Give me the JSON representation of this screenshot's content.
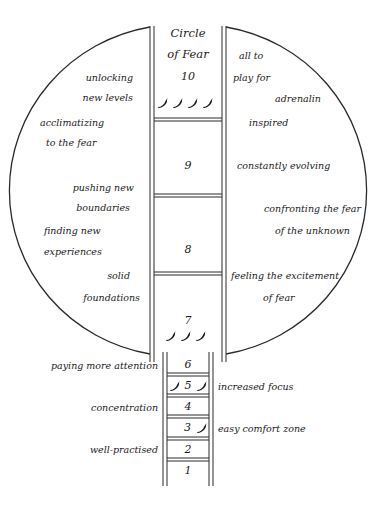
{
  "diagram": {
    "title_line1": "Circle",
    "title_line2": "of Fear",
    "type": "ladder-in-circle",
    "colors": {
      "line": "#2a2a2a",
      "text": "#1a1a1a",
      "pepper": "#1a1a1a",
      "background": "#ffffff"
    }
  },
  "rungs": [
    {
      "level": "10",
      "peppers": 4
    },
    {
      "level": "9",
      "peppers": 0
    },
    {
      "level": "8",
      "peppers": 0
    },
    {
      "level": "7",
      "peppers": 3
    },
    {
      "level": "6",
      "peppers": 0
    },
    {
      "level": "5",
      "peppers": 2
    },
    {
      "level": "4",
      "peppers": 0
    },
    {
      "level": "3",
      "peppers": 1
    },
    {
      "level": "2",
      "peppers": 0
    },
    {
      "level": "1",
      "peppers": 0
    }
  ],
  "left_labels": [
    "unlocking",
    "new levels",
    "acclimatizing",
    "to the fear",
    "pushing new",
    "boundaries",
    "finding new",
    "experiences",
    "solid",
    "foundations",
    "paying more attention",
    "concentration",
    "well-practised"
  ],
  "right_labels": [
    "all to",
    "play for",
    "adrenalin",
    "inspired",
    "constantly evolving",
    "confronting the fear",
    "of the unknown",
    "feeling the excitement",
    "of fear",
    "increased focus",
    "easy comfort zone"
  ],
  "icons": {
    "pepper": "chili-pepper-icon"
  }
}
